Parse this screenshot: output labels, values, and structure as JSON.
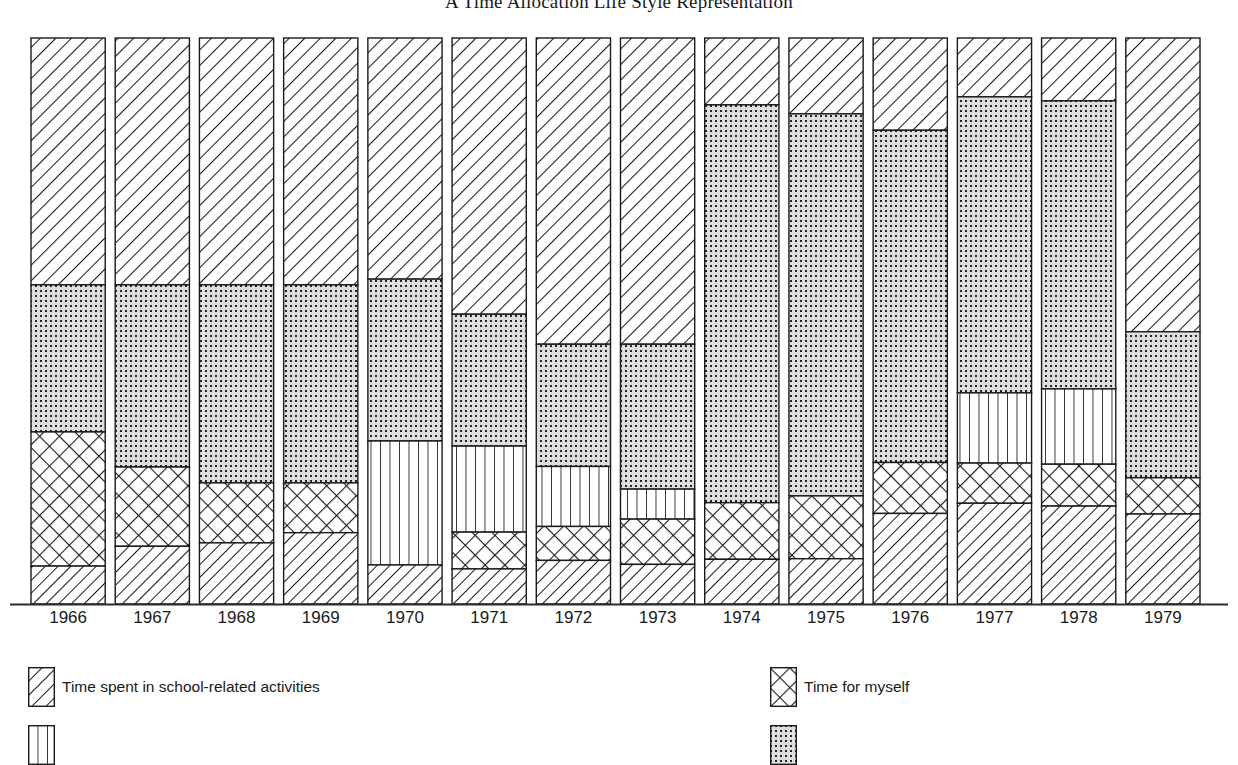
{
  "title": "A Time Allocation Life Style Representation",
  "colors": {
    "ink": "#1a1a1a",
    "axis": "#2b2b2b",
    "paper": "#ffffff",
    "dotted_fill": "#d9d9d9"
  },
  "legend": {
    "items": [
      {
        "label": "Time spent in school-related activities",
        "pattern": "diagonal-hatch",
        "icon": "diagonal-hatch-swatch-icon",
        "column": "left",
        "row": 1
      },
      {
        "label": "Time for myself",
        "pattern": "cross-hatch",
        "icon": "cross-hatch-swatch-icon",
        "column": "right",
        "row": 1
      },
      {
        "label": "",
        "pattern": "vertical-lines",
        "icon": "vertical-lines-swatch-icon",
        "column": "left",
        "row": 2
      },
      {
        "label": "",
        "pattern": "dotted",
        "icon": "dotted-swatch-icon",
        "column": "right",
        "row": 2
      }
    ]
  },
  "chart_data": {
    "type": "bar",
    "subtype": "stacked-percentage",
    "title": "A Time Allocation Life Style Representation",
    "xlabel": "",
    "ylabel": "",
    "ylim": [
      0,
      100
    ],
    "grid": false,
    "legend_position": "bottom",
    "axis": {
      "baseline": true,
      "left_spine": false,
      "right_spine": false,
      "top_spine": false
    },
    "categories": [
      "1966",
      "1967",
      "1968",
      "1969",
      "1970",
      "1971",
      "1972",
      "1973",
      "1974",
      "1975",
      "1976",
      "1977",
      "1978",
      "1979"
    ],
    "series": [
      {
        "name": "Time spent in school-related activities",
        "pattern": "diagonal-hatch",
        "stack_order": 1,
        "values": [
          43.6,
          43.6,
          43.6,
          43.6,
          42.6,
          48.8,
          54.1,
          54.1,
          11.8,
          13.4,
          16.3,
          10.4,
          11.1,
          51.9
        ]
      },
      {
        "name": "Dotted segment",
        "pattern": "dotted",
        "stack_order": 2,
        "values": [
          26.0,
          32.2,
          35.0,
          35.0,
          28.6,
          23.3,
          21.6,
          25.6,
          70.3,
          67.5,
          58.7,
          52.3,
          50.9,
          25.8
        ]
      },
      {
        "name": "Vertical-line segment",
        "pattern": "vertical-lines",
        "stack_order": 3,
        "values": [
          0.0,
          0.0,
          0.0,
          0.0,
          21.9,
          15.2,
          10.6,
          5.3,
          0.0,
          0.0,
          0.0,
          12.4,
          13.3,
          0.0
        ]
      },
      {
        "name": "Time for myself",
        "pattern": "cross-hatch",
        "stack_order": 4,
        "values": [
          23.7,
          14.0,
          10.6,
          8.8,
          0.0,
          6.5,
          6.0,
          8.0,
          10.0,
          11.1,
          9.0,
          7.1,
          7.4,
          6.4
        ]
      },
      {
        "name": "Bottom diagonal segment",
        "pattern": "diagonal-hatch-steep",
        "stack_order": 5,
        "values": [
          6.7,
          10.2,
          10.8,
          12.6,
          6.9,
          6.2,
          7.7,
          7.0,
          7.9,
          8.0,
          16.0,
          17.8,
          17.3,
          15.9
        ]
      }
    ]
  }
}
